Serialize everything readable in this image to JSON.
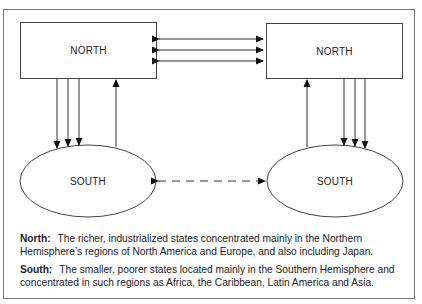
{
  "diagram": {
    "nodes": [
      {
        "id": "north-left",
        "shape": "rectangle",
        "label": "NORTH"
      },
      {
        "id": "north-right",
        "shape": "rectangle",
        "label": "NORTH"
      },
      {
        "id": "south-left",
        "shape": "ellipse",
        "label": "SOUTH"
      },
      {
        "id": "south-right",
        "shape": "ellipse",
        "label": "SOUTH"
      }
    ],
    "edges": [
      {
        "from": "north-left",
        "to": "north-right",
        "count": 3,
        "style": "solid",
        "direction": "bidirectional"
      },
      {
        "from": "north-left",
        "to": "south-left",
        "count": 3,
        "style": "solid",
        "direction": "down"
      },
      {
        "from": "south-left",
        "to": "north-left",
        "count": 1,
        "style": "solid",
        "direction": "up"
      },
      {
        "from": "north-right",
        "to": "south-right",
        "count": 3,
        "style": "solid",
        "direction": "down"
      },
      {
        "from": "south-right",
        "to": "north-right",
        "count": 1,
        "style": "solid",
        "direction": "up"
      },
      {
        "from": "south-left",
        "to": "south-right",
        "count": 1,
        "style": "dashed",
        "direction": "bidirectional"
      }
    ]
  },
  "legend": {
    "north": {
      "term": "North:",
      "definition": "The richer, industrialized states concentrated mainly in the Northern Hemisphere’s regions of North America and Europe, and also including Japan."
    },
    "south": {
      "term": "South:",
      "definition": "The smaller, poorer states located mainly in the Southern Hemisphere and concentrated in such regions as Africa, the Caribbean, Latin America and Asia."
    }
  }
}
